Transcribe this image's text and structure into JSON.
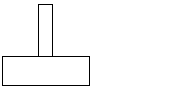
{
  "diagram": {
    "stroke_color": "#000000",
    "fill_color": "#ffffff",
    "shapes": [
      {
        "id": "vertical-post",
        "type": "rectangle",
        "x": 38,
        "y": 4,
        "width": 15,
        "height": 53
      },
      {
        "id": "horizontal-base",
        "type": "rectangle",
        "x": 2,
        "y": 56,
        "width": 88,
        "height": 30
      }
    ]
  }
}
